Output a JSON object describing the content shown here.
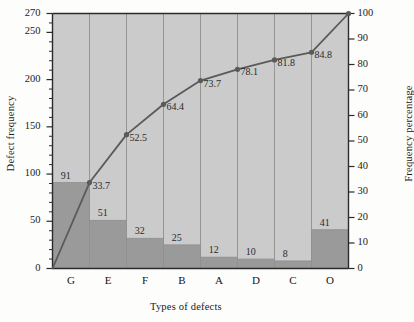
{
  "chart_data": {
    "type": "bar",
    "title": "",
    "subtitle": "",
    "xlabel": "Types of defects",
    "ylabel": "Defect frequency",
    "y2label": "Frequency percentage",
    "categories": [
      "G",
      "E",
      "F",
      "B",
      "A",
      "D",
      "C",
      "O"
    ],
    "values": [
      91,
      51,
      32,
      25,
      12,
      10,
      8,
      41
    ],
    "series": [
      {
        "name": "Defect frequency",
        "type": "bar",
        "axis": "left",
        "values": [
          91,
          51,
          32,
          25,
          12,
          10,
          8,
          41
        ],
        "labels": [
          "91",
          "51",
          "32",
          "25",
          "12",
          "10",
          "8",
          "41"
        ]
      },
      {
        "name": "Frequency percentage",
        "type": "line",
        "axis": "right",
        "values": [
          33.7,
          52.5,
          64.4,
          73.7,
          78.1,
          81.8,
          84.8,
          100
        ],
        "labels": [
          "33.7",
          "52.5",
          "64.4",
          "73.7",
          "78.1",
          "81.8",
          "84.8",
          ""
        ]
      }
    ],
    "ylim": [
      0,
      270
    ],
    "y2lim": [
      0,
      100
    ],
    "yticks": [
      0,
      50,
      100,
      150,
      200,
      250,
      270
    ],
    "yticklabels": [
      "0",
      "50",
      "100",
      "150",
      "200",
      "250",
      "270"
    ],
    "yminorticks": [
      10,
      20,
      30,
      40,
      60,
      70,
      80,
      90,
      110,
      120,
      130,
      140,
      160,
      170,
      180,
      190,
      210,
      220,
      230,
      240,
      260
    ],
    "y2ticks": [
      0,
      10,
      20,
      30,
      40,
      50,
      60,
      70,
      80,
      90,
      100
    ],
    "y2ticklabels": [
      "0",
      "10",
      "20",
      "30",
      "40",
      "50",
      "60",
      "70",
      "80",
      "90",
      "100"
    ],
    "grid": "vertical",
    "legend": "none",
    "colors": {
      "bar_fill": "#9a9a9a",
      "plot_background": "#cbcbcb",
      "page_background": "#fdfdfb",
      "line": "#5a5a5a",
      "axis": "#2b2b2b",
      "gridline": "#8f8f8f",
      "text": "#1a1a1a"
    }
  }
}
